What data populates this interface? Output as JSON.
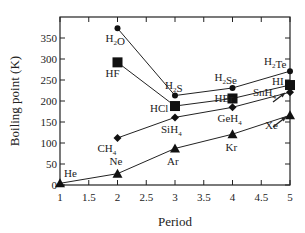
{
  "chart_data": {
    "type": "line",
    "title": "",
    "xlabel": "Period",
    "ylabel": "Boiling point (K)",
    "xlim": [
      1,
      5
    ],
    "ylim": [
      0,
      390
    ],
    "x_ticks": [
      "1",
      "1.5",
      "2",
      "2.5",
      "3",
      "3.5",
      "4",
      "4.5",
      "5"
    ],
    "y_ticks": [
      "0",
      "50",
      "100",
      "150",
      "200",
      "250",
      "300",
      "350"
    ],
    "grid": false,
    "series": [
      {
        "name": "Group 16 hydrides",
        "marker": "circle",
        "points": [
          {
            "x": 2,
            "y": 373,
            "label": "H2O"
          },
          {
            "x": 3,
            "y": 213,
            "label": "H2S"
          },
          {
            "x": 4,
            "y": 231,
            "label": "H2Se"
          },
          {
            "x": 5,
            "y": 271,
            "label": "H2Te"
          }
        ]
      },
      {
        "name": "Group 17 hydrides",
        "marker": "square",
        "points": [
          {
            "x": 2,
            "y": 292,
            "label": "HF"
          },
          {
            "x": 3,
            "y": 188,
            "label": "HCl"
          },
          {
            "x": 4,
            "y": 206,
            "label": "HBr"
          },
          {
            "x": 5,
            "y": 238,
            "label": "HI"
          }
        ]
      },
      {
        "name": "Group 14 hydrides",
        "marker": "diamond",
        "points": [
          {
            "x": 2,
            "y": 112,
            "label": "CH4"
          },
          {
            "x": 3,
            "y": 161,
            "label": "SiH4"
          },
          {
            "x": 4,
            "y": 185,
            "label": "GeH4"
          },
          {
            "x": 5,
            "y": 221,
            "label": "SnH4"
          }
        ]
      },
      {
        "name": "Noble gases",
        "marker": "triangle",
        "points": [
          {
            "x": 1,
            "y": 4,
            "label": "He"
          },
          {
            "x": 2,
            "y": 27,
            "label": "Ne"
          },
          {
            "x": 3,
            "y": 87,
            "label": "Ar"
          },
          {
            "x": 4,
            "y": 121,
            "label": "Kr"
          },
          {
            "x": 5,
            "y": 166,
            "label": "Xe"
          }
        ]
      }
    ]
  }
}
